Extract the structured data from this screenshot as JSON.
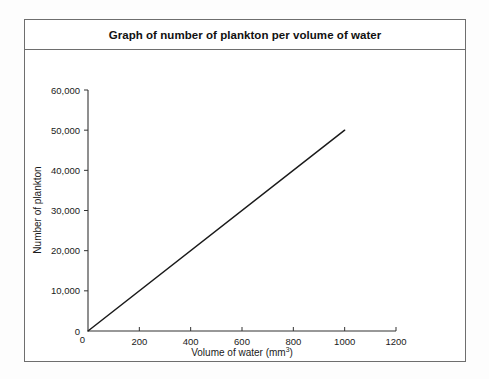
{
  "figure": {
    "title": "Graph of number of plankton per volume of water"
  },
  "chart_data": {
    "type": "line",
    "title": "Graph of number of plankton per volume of water",
    "xlabel_text": "Volume of water (mm",
    "xlabel_sup": "3",
    "xlabel_close": ")",
    "xlabel_full": "Volume of water (mm3)",
    "ylabel": "Number of plankton",
    "xlim": [
      0,
      1200
    ],
    "ylim": [
      0,
      60000
    ],
    "grid": false,
    "legend": false,
    "xticks": [
      0,
      200,
      400,
      600,
      800,
      1000,
      1200
    ],
    "xtick_labels": [
      "0",
      "200",
      "400",
      "600",
      "800",
      "1000",
      "1200"
    ],
    "yticks": [
      0,
      10000,
      20000,
      30000,
      40000,
      50000,
      60000
    ],
    "ytick_labels": [
      "0",
      "10,000",
      "20,000",
      "30,000",
      "40,000",
      "50,000",
      "60,000"
    ],
    "series": [
      {
        "name": "plankton count",
        "color": "#1a1a1a",
        "x": [
          0,
          1000
        ],
        "y": [
          0,
          50000
        ],
        "slope_per_mm3": 50,
        "points": [
          {
            "x": 0,
            "y": 0
          },
          {
            "x": 200,
            "y": 10000
          },
          {
            "x": 400,
            "y": 20000
          },
          {
            "x": 600,
            "y": 30000
          },
          {
            "x": 800,
            "y": 40000
          },
          {
            "x": 1000,
            "y": 50000
          }
        ]
      }
    ]
  },
  "colors": {
    "frame": "#6e6e6e",
    "axis": "#333333",
    "line": "#1a1a1a",
    "text": "#111111",
    "background": "#ffffff"
  }
}
